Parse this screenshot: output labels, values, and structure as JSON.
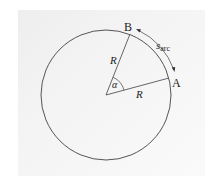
{
  "diagram": {
    "title": "",
    "points": {
      "A": "A",
      "B": "B"
    },
    "radius_label_1": "R",
    "radius_label_2": "R",
    "angle_label": "α",
    "arc_label_main": "s",
    "arc_label_sub": "arc",
    "colors": {
      "line": "#555555",
      "text": "#222222",
      "panel": "#f2f2f2",
      "background": "#ffffff"
    },
    "geometry": {
      "center": [
        106,
        95
      ],
      "radius": 65,
      "point_A": [
        169,
        78
      ],
      "point_B": [
        130,
        34
      ]
    }
  }
}
